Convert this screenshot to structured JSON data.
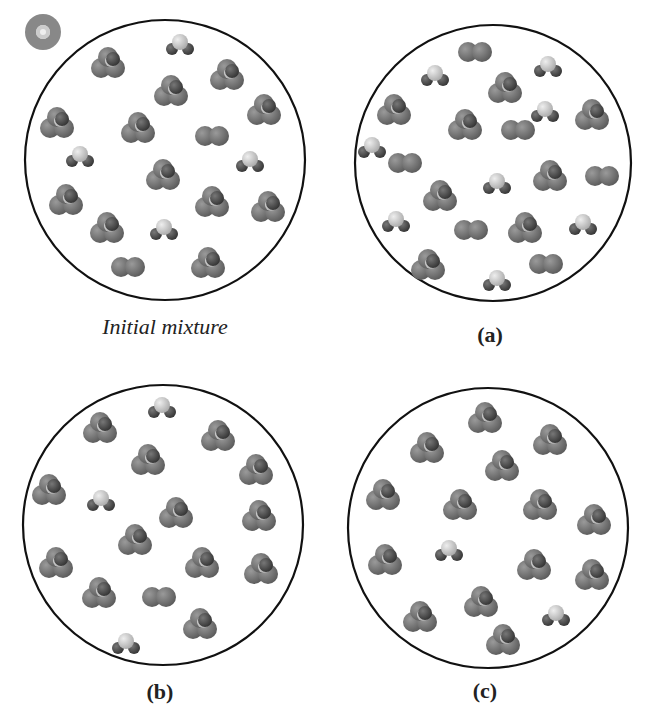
{
  "figure": {
    "icon": "cd-icon",
    "panels": [
      {
        "id": "initial",
        "label": "Initial mixture",
        "style": "italic",
        "cx": 165,
        "cy": 160,
        "r": 140,
        "label_x": 165,
        "label_y": 328,
        "molecules": [
          {
            "t": "small",
            "x": 180,
            "y": 44
          },
          {
            "t": "big",
            "x": 108,
            "y": 63
          },
          {
            "t": "big",
            "x": 227,
            "y": 75
          },
          {
            "t": "big",
            "x": 171,
            "y": 91
          },
          {
            "t": "big",
            "x": 264,
            "y": 110
          },
          {
            "t": "big",
            "x": 57,
            "y": 123
          },
          {
            "t": "big",
            "x": 138,
            "y": 128
          },
          {
            "t": "o2",
            "x": 212,
            "y": 136
          },
          {
            "t": "small",
            "x": 80,
            "y": 156
          },
          {
            "t": "small",
            "x": 250,
            "y": 161
          },
          {
            "t": "big",
            "x": 163,
            "y": 175
          },
          {
            "t": "big",
            "x": 66,
            "y": 200
          },
          {
            "t": "big",
            "x": 212,
            "y": 202
          },
          {
            "t": "big",
            "x": 268,
            "y": 207
          },
          {
            "t": "big",
            "x": 107,
            "y": 228
          },
          {
            "t": "small",
            "x": 164,
            "y": 229
          },
          {
            "t": "o2",
            "x": 128,
            "y": 267
          },
          {
            "t": "big",
            "x": 208,
            "y": 263
          }
        ]
      },
      {
        "id": "a",
        "label": "(a)",
        "style": "bold",
        "cx": 493,
        "cy": 163,
        "r": 138,
        "label_x": 490,
        "label_y": 336,
        "molecules": [
          {
            "t": "o2",
            "x": 475,
            "y": 52
          },
          {
            "t": "small",
            "x": 548,
            "y": 66
          },
          {
            "t": "small",
            "x": 435,
            "y": 75
          },
          {
            "t": "big",
            "x": 505,
            "y": 88
          },
          {
            "t": "big",
            "x": 394,
            "y": 110
          },
          {
            "t": "small",
            "x": 545,
            "y": 111
          },
          {
            "t": "big",
            "x": 592,
            "y": 115
          },
          {
            "t": "big",
            "x": 465,
            "y": 125
          },
          {
            "t": "o2",
            "x": 518,
            "y": 130
          },
          {
            "t": "small",
            "x": 372,
            "y": 147
          },
          {
            "t": "o2",
            "x": 405,
            "y": 163
          },
          {
            "t": "small",
            "x": 497,
            "y": 183
          },
          {
            "t": "big",
            "x": 550,
            "y": 176
          },
          {
            "t": "o2",
            "x": 602,
            "y": 176
          },
          {
            "t": "big",
            "x": 440,
            "y": 196
          },
          {
            "t": "small",
            "x": 396,
            "y": 221
          },
          {
            "t": "o2",
            "x": 471,
            "y": 230
          },
          {
            "t": "big",
            "x": 525,
            "y": 228
          },
          {
            "t": "small",
            "x": 583,
            "y": 224
          },
          {
            "t": "big",
            "x": 428,
            "y": 265
          },
          {
            "t": "small",
            "x": 497,
            "y": 280
          },
          {
            "t": "o2",
            "x": 546,
            "y": 264
          }
        ]
      },
      {
        "id": "b",
        "label": "(b)",
        "style": "bold",
        "cx": 163,
        "cy": 525,
        "r": 140,
        "label_x": 160,
        "label_y": 693,
        "molecules": [
          {
            "t": "small",
            "x": 162,
            "y": 407
          },
          {
            "t": "big",
            "x": 100,
            "y": 428
          },
          {
            "t": "big",
            "x": 218,
            "y": 436
          },
          {
            "t": "big",
            "x": 148,
            "y": 460
          },
          {
            "t": "big",
            "x": 256,
            "y": 470
          },
          {
            "t": "big",
            "x": 49,
            "y": 490
          },
          {
            "t": "small",
            "x": 101,
            "y": 500
          },
          {
            "t": "big",
            "x": 176,
            "y": 513
          },
          {
            "t": "big",
            "x": 259,
            "y": 516
          },
          {
            "t": "big",
            "x": 135,
            "y": 540
          },
          {
            "t": "big",
            "x": 56,
            "y": 563
          },
          {
            "t": "big",
            "x": 202,
            "y": 563
          },
          {
            "t": "big",
            "x": 261,
            "y": 569
          },
          {
            "t": "big",
            "x": 99,
            "y": 593
          },
          {
            "t": "o2",
            "x": 159,
            "y": 597
          },
          {
            "t": "big",
            "x": 200,
            "y": 624
          },
          {
            "t": "small",
            "x": 126,
            "y": 643
          }
        ]
      },
      {
        "id": "c",
        "label": "(c)",
        "style": "bold",
        "cx": 488,
        "cy": 528,
        "r": 140,
        "label_x": 485,
        "label_y": 692,
        "molecules": [
          {
            "t": "big",
            "x": 485,
            "y": 418
          },
          {
            "t": "big",
            "x": 427,
            "y": 448
          },
          {
            "t": "big",
            "x": 550,
            "y": 440
          },
          {
            "t": "big",
            "x": 502,
            "y": 466
          },
          {
            "t": "big",
            "x": 383,
            "y": 495
          },
          {
            "t": "big",
            "x": 460,
            "y": 505
          },
          {
            "t": "big",
            "x": 540,
            "y": 505
          },
          {
            "t": "big",
            "x": 594,
            "y": 520
          },
          {
            "t": "small",
            "x": 449,
            "y": 550
          },
          {
            "t": "big",
            "x": 385,
            "y": 560
          },
          {
            "t": "big",
            "x": 534,
            "y": 565
          },
          {
            "t": "big",
            "x": 592,
            "y": 575
          },
          {
            "t": "big",
            "x": 481,
            "y": 602
          },
          {
            "t": "big",
            "x": 420,
            "y": 617
          },
          {
            "t": "small",
            "x": 556,
            "y": 615
          },
          {
            "t": "big",
            "x": 503,
            "y": 640
          }
        ]
      }
    ]
  }
}
